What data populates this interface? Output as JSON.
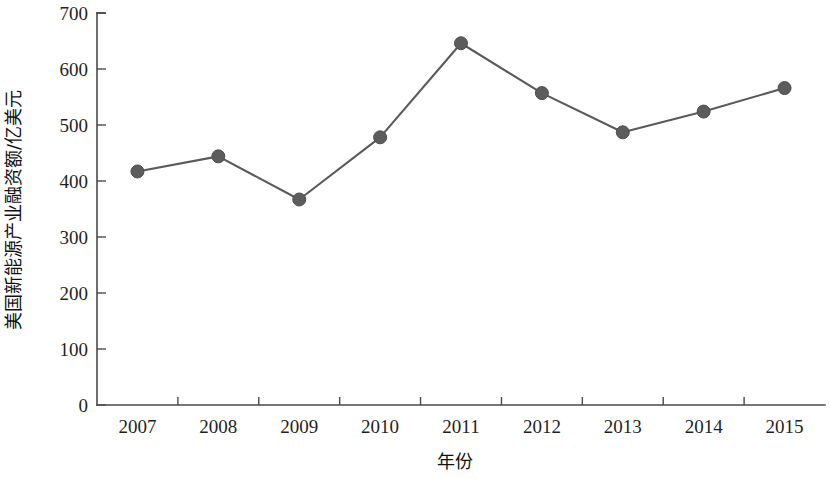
{
  "chart_data": {
    "type": "line",
    "title": "",
    "subtitle": "",
    "xlabel": "年份",
    "ylabel": "美国新能源产业融资额/亿美元",
    "categories": [
      "2007",
      "2008",
      "2009",
      "2010",
      "2011",
      "2012",
      "2013",
      "2014",
      "2015"
    ],
    "values": [
      417,
      444,
      367,
      478,
      646,
      557,
      487,
      524,
      566
    ],
    "series": [
      {
        "name": "美国新能源产业融资额",
        "values": [
          417,
          444,
          367,
          478,
          646,
          557,
          487,
          524,
          566
        ]
      }
    ],
    "ylim": [
      0,
      700
    ],
    "y_ticks": [
      "0",
      "100",
      "200",
      "300",
      "400",
      "500",
      "600",
      "700"
    ],
    "y_tick_values": [
      0,
      100,
      200,
      300,
      400,
      500,
      600,
      700
    ],
    "grid": false,
    "legend": "none",
    "units": "亿美元",
    "line_color": "#5a5a5a",
    "marker_color": "#5c5c5c",
    "axis_color": "#4a4a4a",
    "background_color": "#ffffff"
  },
  "axes": {
    "x_title": "年份",
    "y_title": "美国新能源产业融资额/亿美元"
  }
}
